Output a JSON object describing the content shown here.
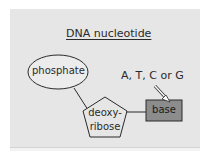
{
  "diagram": {
    "title": "DNA nucleotide",
    "nodes": [
      {
        "id": "phosphate",
        "shape": "ellipse",
        "label": "phosphate"
      },
      {
        "id": "deoxyribose",
        "shape": "pentagon",
        "label_line1": "deoxy-",
        "label_line2": "ribose"
      },
      {
        "id": "base",
        "shape": "rectangle",
        "label": "base",
        "fill": "#8c8c8c"
      }
    ],
    "edges": [
      {
        "from": "phosphate",
        "to": "deoxyribose"
      },
      {
        "from": "deoxyribose",
        "to": "base"
      }
    ],
    "annotation": {
      "text": "A, T, C or G",
      "points_to": "base"
    },
    "colors": {
      "panel": "#e6e6e6",
      "stroke": "#2a2a2a",
      "base_fill": "#8c8c8c"
    }
  }
}
